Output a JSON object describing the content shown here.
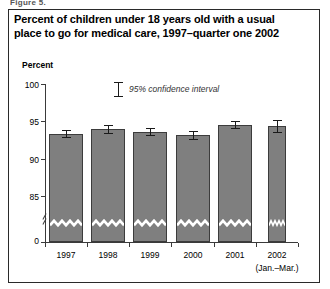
{
  "top_strip_text": "Figure 5.",
  "figure": {
    "title": "Percent of children under 18 years old with a usual place to go for medical care, 1997–quarter one 2002",
    "legend_label": "95% confidence interval",
    "legend_icon": "error-bar-icon"
  },
  "chart_data": {
    "type": "bar",
    "title": "Percent of children under 18 years old with a usual place to go for medical care, 1997–quarter one 2002",
    "xlabel": "",
    "ylabel": "Percent",
    "categories": [
      "1997",
      "1998",
      "1999",
      "2000",
      "2001",
      "2002"
    ],
    "category_sublabels": [
      "",
      "",
      "",
      "",
      "",
      "(Jan.–Mar.)"
    ],
    "values": [
      93.3,
      93.9,
      93.6,
      93.1,
      94.5,
      94.3
    ],
    "error_low": [
      92.9,
      93.4,
      93.2,
      92.6,
      94.1,
      93.5
    ],
    "error_high": [
      93.8,
      94.5,
      94.1,
      93.7,
      95.0,
      95.1
    ],
    "ylim": [
      83.5,
      101
    ],
    "yticks": [
      85,
      90,
      95,
      100
    ],
    "ytick_labels": [
      "85",
      "90",
      "95",
      "100"
    ],
    "zero_tick_label": "0",
    "axis_break": true,
    "bar_break_marker": "zigzag",
    "grid": false,
    "legend": "95% confidence interval",
    "legend_position": "inside-top-center",
    "bar_color": "#7f7f7f",
    "bar_edge_color": "#3c3c3c",
    "error_bar_color": "#1a1a1a",
    "axis_color": "#3a3a3a"
  }
}
